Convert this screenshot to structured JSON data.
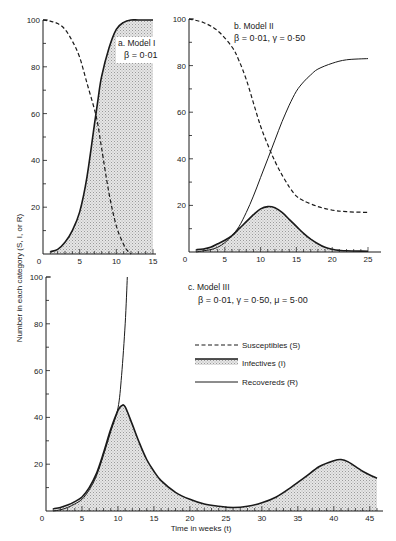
{
  "figure": {
    "ylabel": "Number in each category (S, I, or R)",
    "xlabel": "Time in weeks (t)"
  },
  "legend": {
    "items": [
      {
        "key": "S",
        "label": "Susceptibles (S)",
        "style": "dashed"
      },
      {
        "key": "I",
        "label": "Infectives (I)",
        "style": "thick-shaded"
      },
      {
        "key": "R",
        "label": "Recovereds (R)",
        "style": "solid"
      }
    ]
  },
  "colors": {
    "ink": "#1a1a1a",
    "shade": "#d6d6d6",
    "background": "#ffffff"
  },
  "chart_data": [
    {
      "id": "a",
      "type": "line",
      "title": "a. Model I",
      "params": "β = 0·01",
      "xlim": [
        0,
        15
      ],
      "ylim": [
        0,
        100
      ],
      "xticks": [
        0,
        5,
        10,
        15
      ],
      "yticks": [
        20,
        40,
        60,
        80,
        100
      ],
      "grid": false,
      "series": [
        {
          "name": "Susceptibles (S)",
          "style": "dashed",
          "x": [
            0,
            1,
            2,
            3,
            4,
            5,
            6,
            7,
            7.5,
            8,
            9,
            10,
            11,
            11.5,
            12
          ],
          "y": [
            100,
            99.5,
            98.5,
            96,
            91,
            84,
            73,
            62,
            55,
            45,
            26,
            12,
            4,
            1.5,
            0
          ]
        },
        {
          "name": "Infectives (I)",
          "style": "thick-shaded",
          "x": [
            1,
            2,
            3,
            4,
            5,
            6,
            7,
            7.5,
            8,
            9,
            10,
            11,
            12,
            13,
            15
          ],
          "y": [
            1,
            2,
            5,
            10,
            18,
            33,
            55,
            66,
            76,
            88,
            96,
            99,
            100,
            100,
            100
          ]
        }
      ]
    },
    {
      "id": "b",
      "type": "line",
      "title": "b. Model II",
      "params": "β = 0·01,  γ = 0·50",
      "xlim": [
        0,
        25
      ],
      "ylim": [
        0,
        100
      ],
      "xticks": [
        0,
        5,
        10,
        15,
        20,
        25
      ],
      "yticks": [
        20,
        40,
        60,
        80,
        100
      ],
      "grid": false,
      "series": [
        {
          "name": "Susceptibles (S)",
          "style": "dashed",
          "x": [
            0,
            2,
            4,
            6,
            7,
            8,
            9,
            10,
            11,
            12,
            13,
            14,
            15,
            16,
            18,
            20,
            22,
            25
          ],
          "y": [
            100,
            98.5,
            95,
            88,
            82,
            74,
            64,
            54,
            46,
            39,
            33,
            28,
            24,
            22,
            19.5,
            18,
            17.3,
            17
          ]
        },
        {
          "name": "Infectives (I)",
          "style": "thick-shaded",
          "x": [
            1,
            2,
            3,
            4,
            5,
            6,
            7,
            8,
            9,
            10,
            11,
            12,
            13,
            14,
            15,
            16,
            17,
            18,
            19,
            20,
            21,
            22,
            25
          ],
          "y": [
            1,
            1.3,
            2,
            3.5,
            5,
            7,
            10,
            13,
            16,
            18.5,
            19.5,
            19,
            17,
            14,
            11,
            8,
            5.5,
            3.5,
            2,
            1.2,
            0.7,
            0.5,
            0.3
          ]
        },
        {
          "name": "Recovereds (R)",
          "style": "solid",
          "x": [
            1,
            2,
            3,
            4,
            5,
            6,
            7,
            8,
            9,
            10,
            11,
            12,
            13,
            14,
            15,
            16,
            17,
            18,
            20,
            22,
            25
          ],
          "y": [
            0,
            0.5,
            1,
            2,
            4,
            7,
            11,
            17,
            24,
            32,
            40,
            48,
            56,
            63,
            69,
            73,
            76,
            78.5,
            81,
            82.5,
            83
          ]
        }
      ]
    },
    {
      "id": "c",
      "type": "line",
      "title": "c. Model III",
      "params": "β = 0·01,  γ = 0·50,  μ = 5·00",
      "xlim": [
        0,
        46
      ],
      "ylim": [
        0,
        100
      ],
      "xticks": [
        0,
        5,
        10,
        15,
        20,
        25,
        30,
        35,
        40,
        45
      ],
      "yticks": [
        20,
        40,
        60,
        80,
        100
      ],
      "grid": false,
      "series": [
        {
          "name": "Infectives (I)",
          "style": "thick-shaded",
          "x": [
            1,
            2,
            3,
            4,
            5,
            6,
            7,
            8,
            9,
            10,
            10.5,
            11,
            12,
            13,
            14,
            15,
            16,
            18,
            20,
            22,
            24,
            26,
            28,
            30,
            32,
            34,
            36,
            38,
            40,
            41,
            42,
            44,
            46
          ],
          "y": [
            1,
            1.5,
            2.5,
            4,
            6,
            10,
            16,
            25,
            35,
            43,
            45,
            44.5,
            37,
            29,
            22,
            17,
            13,
            8,
            5,
            3,
            2,
            1.5,
            2,
            3.5,
            6,
            10,
            14.5,
            19,
            21.5,
            22,
            21,
            17,
            14
          ]
        },
        {
          "name": "Recovereds (R)",
          "style": "solid",
          "x": [
            1,
            2,
            3,
            4,
            5,
            6,
            7,
            8,
            9,
            10,
            10.5,
            11,
            11.3
          ],
          "y": [
            0,
            0.5,
            1.5,
            3,
            5,
            9,
            15,
            24,
            34,
            44,
            58,
            80,
            100
          ]
        }
      ]
    }
  ]
}
